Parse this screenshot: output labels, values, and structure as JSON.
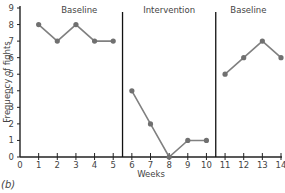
{
  "chart_data": {
    "type": "line",
    "title": "",
    "xlabel": "Weeks",
    "ylabel": "Frequency of fights",
    "xlim": [
      0,
      14
    ],
    "ylim": [
      0,
      9
    ],
    "x_ticks": [
      0,
      1,
      2,
      3,
      4,
      5,
      6,
      7,
      8,
      9,
      10,
      11,
      12,
      13,
      14
    ],
    "y_ticks": [
      0,
      1,
      2,
      3,
      4,
      5,
      6,
      7,
      8,
      9
    ],
    "grid": false,
    "phases": [
      {
        "label": "Baseline",
        "x_start": 0,
        "x_end": 5.5
      },
      {
        "label": "Intervention",
        "x_start": 5.5,
        "x_end": 10.5
      },
      {
        "label": "Baseline",
        "x_start": 10.5,
        "x_end": 14
      }
    ],
    "phase_lines": [
      5.5,
      10.5
    ],
    "series": [
      {
        "name": "Baseline",
        "x": [
          1,
          2,
          3,
          4,
          5
        ],
        "values": [
          8,
          7,
          8,
          7,
          7
        ]
      },
      {
        "name": "Intervention",
        "x": [
          6,
          7,
          8,
          9,
          10
        ],
        "values": [
          4,
          2,
          0,
          1,
          1
        ]
      },
      {
        "name": "Baseline",
        "x": [
          11,
          12,
          13,
          14
        ],
        "values": [
          5,
          6,
          7,
          6
        ]
      }
    ],
    "panel_label": "(b)",
    "colors": {
      "line": "#808080",
      "marker": "#707070",
      "axis": "#222222"
    }
  }
}
